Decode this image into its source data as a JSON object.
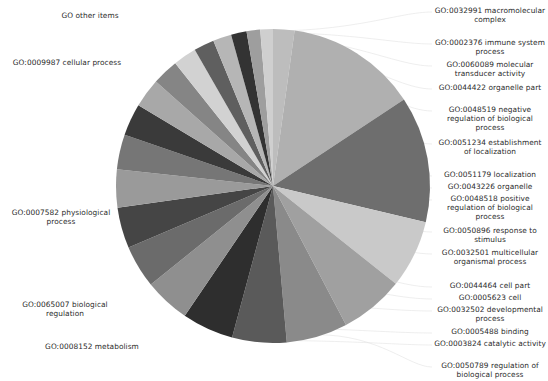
{
  "chart_data": {
    "type": "pie",
    "title": "",
    "legend_position": "labels-around-pie",
    "grid": false,
    "start_angle_deg": -90,
    "direction": "clockwise",
    "categories": [
      "GO other items",
      "GO:0009987 cellular process",
      "GO:0007582 physiological process",
      "GO:0065007 biological regulation",
      "GO:0008152 metabolism",
      "GO:0050789 regulation of biological process",
      "GO:0003824 catalytic activity",
      "GO:0005488 binding",
      "GO:0032502 developmental process",
      "GO:0005623 cell",
      "GO:0044464 cell part",
      "GO:0032501 multicellular organismal process",
      "GO:0050896 response to stimulus",
      "GO:0048518 positive regulation of biological process",
      "GO:0043226 organelle",
      "GO:0051179 localization",
      "GO:0051234 establishment of localization",
      "GO:0048519 negative regulation of biological process",
      "GO:0044422 organelle part",
      "GO:0060089 molecular transducer activity",
      "GO:0002376 immune system process",
      "GO:0032991 macromolecular complex"
    ],
    "values": [
      2.2,
      13.5,
      13.0,
      7.0,
      6.6,
      6.3,
      5.6,
      5.3,
      4.7,
      4.4,
      4.2,
      3.9,
      3.6,
      3.3,
      3.0,
      2.7,
      2.4,
      2.1,
      1.9,
      1.6,
      1.4,
      1.3
    ],
    "colors": [
      "#bdbdbd",
      "#b0b0b0",
      "#6e6e6e",
      "#c9c9c9",
      "#a0a0a0",
      "#8a8a8a",
      "#5a5a5a",
      "#2e2e2e",
      "#8f8f8f",
      "#6b6b6b",
      "#454545",
      "#9a9a9a",
      "#767676",
      "#3a3a3a",
      "#a8a8a8",
      "#858585",
      "#d2d2d2",
      "#5f5f5f",
      "#b6b6b6",
      "#333333",
      "#9e9e9e",
      "#cfcfcf"
    ],
    "xlabel": "",
    "ylabel": ""
  },
  "labels": {
    "left": [
      {
        "text": "GO other items",
        "x": 42,
        "y": 11,
        "w": 96
      },
      {
        "text": "GO:0009987 cellular process",
        "x": 8,
        "y": 58,
        "w": 118
      },
      {
        "text": "GO:0007582 physiological process",
        "x": 2,
        "y": 208,
        "w": 118
      },
      {
        "text": "GO:0065007 biological regulation",
        "x": 6,
        "y": 300,
        "w": 118
      },
      {
        "text": "GO:0008152 metabolism",
        "x": 38,
        "y": 342,
        "w": 108
      }
    ],
    "right": [
      {
        "text": "GO:0032991 macromolecular complex",
        "y": 6
      },
      {
        "text": "GO:0002376 immune system process",
        "y": 38
      },
      {
        "text": "GO:0060089 molecular transducer activity",
        "y": 60
      },
      {
        "text": "GO:0044422 organelle part",
        "y": 83
      },
      {
        "text": "GO:0048519 negative regulation of biological process",
        "y": 105
      },
      {
        "text": "GO:0051234 establishment of localization",
        "y": 138
      },
      {
        "text": "GO:0051179 localization",
        "y": 170
      },
      {
        "text": "GO:0043226 organelle",
        "y": 182
      },
      {
        "text": "GO:0048518 positive regulation of biological process",
        "y": 194
      },
      {
        "text": "GO:0050896 response to stimulus",
        "y": 226
      },
      {
        "text": "GO:0032501 multicellular organismal process",
        "y": 248
      },
      {
        "text": "GO:0044464 cell part",
        "y": 281
      },
      {
        "text": "GO:0005623 cell",
        "y": 293
      },
      {
        "text": "GO:0032502 developmental process",
        "y": 305
      },
      {
        "text": "GO:0005488 binding",
        "y": 327
      },
      {
        "text": "GO:0003824 catalytic activity",
        "y": 339
      },
      {
        "text": "GO:0050789 regulation of biological process",
        "y": 361
      }
    ]
  }
}
